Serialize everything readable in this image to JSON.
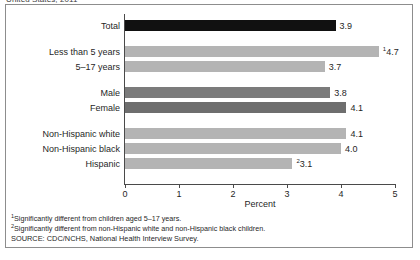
{
  "chart_data": {
    "type": "bar",
    "orientation": "horizontal",
    "title": "United States, 2011",
    "xlabel": "Percent",
    "ylabel": "",
    "xlim": [
      0,
      5
    ],
    "xticks": [
      0,
      1,
      2,
      3,
      4,
      5
    ],
    "grid": false,
    "legend": "none",
    "categories": [
      "Total",
      "Less than 5 years",
      "5–17 years",
      "Male",
      "Female",
      "Non-Hispanic white",
      "Non-Hispanic black",
      "Hispanic"
    ],
    "values": [
      3.9,
      4.7,
      3.7,
      3.8,
      4.1,
      4.1,
      4.0,
      3.1
    ],
    "value_labels": [
      "3.9",
      "4.7",
      "3.7",
      "3.8",
      "4.1",
      "4.1",
      "4.0",
      "3.1"
    ],
    "value_footnote_marks": [
      "",
      "1",
      "",
      "",
      "",
      "",
      "",
      "2"
    ],
    "bar_colors": [
      "#111111",
      "#b4b4b4",
      "#b4b4b4",
      "#7b7b7b",
      "#6e6e6e",
      "#b4b4b4",
      "#b4b4b4",
      "#b4b4b4"
    ],
    "group_breaks_after": [
      "Total",
      "5–17 years",
      "Female"
    ],
    "footnotes": [
      {
        "mark": "1",
        "text": "Significantly different from children aged 5–17 years."
      },
      {
        "mark": "2",
        "text": "Significantly different from non-Hispanic white and non-Hispanic black children."
      }
    ],
    "source": "SOURCE: CDC/NCHS, National Health Interview Survey."
  },
  "colors": {
    "axis": "#4a4a4a",
    "frame": "#8d8d8d",
    "text": "#1f1f1f",
    "bar_total": "#111111",
    "bar_light": "#b4b4b4",
    "bar_dark": "#7b7b7b"
  }
}
